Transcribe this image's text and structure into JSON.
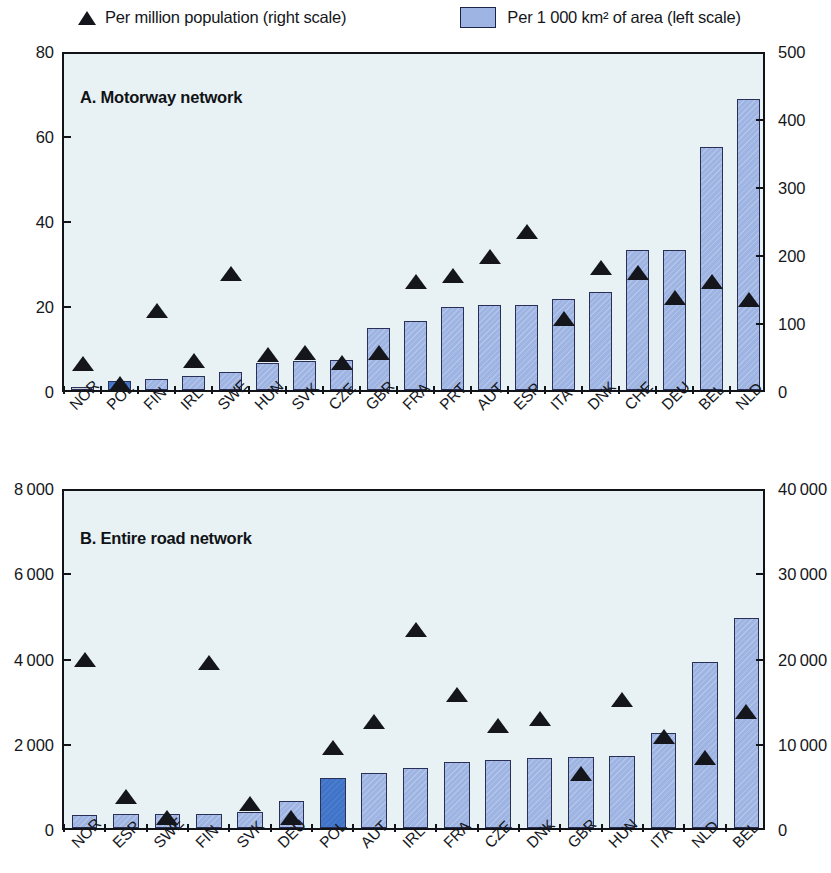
{
  "legend": {
    "series_population": "Per million population (right scale)",
    "series_area": "Per 1 000 km² of area (left scale)",
    "marker_population": "triangle-marker",
    "marker_area": "bar-swatch",
    "bar_color": "#9eb4e2",
    "bar_border_color": "#2a2f55",
    "highlight_color": "#3f74c8",
    "marker_color": "#14161c",
    "plot_background": "#e8f2f4"
  },
  "panels": [
    {
      "id": "A",
      "title": "A. Motorway network",
      "left_axis_ticks": [
        "0",
        "20",
        "40",
        "60",
        "80"
      ],
      "right_axis_ticks": [
        "0",
        "100",
        "200",
        "300",
        "400",
        "500"
      ]
    },
    {
      "id": "B",
      "title": "B. Entire road network",
      "left_axis_ticks": [
        "0",
        "2 000",
        "4 000",
        "6 000",
        "8 000"
      ],
      "right_axis_ticks": [
        "0",
        "10 000",
        "20 000",
        "30 000",
        "40 000"
      ]
    }
  ],
  "chart_data": [
    {
      "type": "bar",
      "title": "A. Motorway network",
      "xlabel": "",
      "ylabel": "Per 1 000 km² of area",
      "y2label": "Per million population",
      "ylim": [
        0,
        80
      ],
      "y2lim": [
        0,
        500
      ],
      "yticks": [
        0,
        20,
        40,
        60,
        80
      ],
      "y2ticks": [
        0,
        100,
        200,
        300,
        400,
        500
      ],
      "grid": false,
      "legend_position": "top",
      "categories": [
        "NOR",
        "POL",
        "FIN",
        "IRL",
        "SWE",
        "HUN",
        "SVK",
        "CZE",
        "GBR",
        "FRA",
        "PRT",
        "AUT",
        "ESP",
        "ITA",
        "DNK",
        "CHE",
        "DEU",
        "BEL",
        "NLD"
      ],
      "highlighted_category": "POL",
      "series": [
        {
          "name": "Per 1 000 km² of area (left scale)",
          "axis": "left",
          "plot": "bar",
          "values": [
            0.8,
            2.2,
            2.5,
            3.3,
            4.2,
            6.3,
            6.8,
            7.1,
            14.7,
            16.2,
            19.6,
            20.0,
            20.1,
            21.4,
            23.0,
            33.0,
            33.0,
            57.2,
            68.5
          ]
        },
        {
          "name": "Per million population (right scale)",
          "axis": "right",
          "plot": "scatter",
          "values": [
            44,
            15,
            122,
            48,
            176,
            57,
            60,
            45,
            60,
            165,
            174,
            202,
            238,
            110,
            186,
            178,
            141,
            165,
            138
          ]
        }
      ]
    },
    {
      "type": "bar",
      "title": "B. Entire road network",
      "xlabel": "",
      "ylabel": "Per 1 000 km² of area",
      "y2label": "Per million population",
      "ylim": [
        0,
        8000
      ],
      "y2lim": [
        0,
        40000
      ],
      "yticks": [
        0,
        2000,
        4000,
        6000,
        8000
      ],
      "y2ticks": [
        0,
        10000,
        20000,
        30000,
        40000
      ],
      "grid": false,
      "legend_position": "top",
      "categories": [
        "NOR",
        "ESP",
        "SWE",
        "FIN",
        "SVK",
        "DEU",
        "POL",
        "AUT",
        "IRL",
        "FRA",
        "CZE",
        "DNK",
        "GBR",
        "HUN",
        "ITA",
        "NLD",
        "BEL"
      ],
      "highlighted_category": "POL",
      "series": [
        {
          "name": "Per 1 000 km² of area (left scale)",
          "axis": "left",
          "plot": "bar",
          "values": [
            300,
            320,
            330,
            340,
            370,
            640,
            1180,
            1280,
            1400,
            1540,
            1600,
            1640,
            1670,
            1680,
            2230,
            3900,
            4920
          ]
        },
        {
          "name": "Per million population (right scale)",
          "axis": "right",
          "plot": "scatter",
          "values": [
            20200,
            4100,
            1700,
            19800,
            3300,
            1700,
            9800,
            12950,
            23700,
            16100,
            12400,
            13200,
            6800,
            15500,
            11200,
            8700,
            14100
          ]
        }
      ]
    }
  ]
}
